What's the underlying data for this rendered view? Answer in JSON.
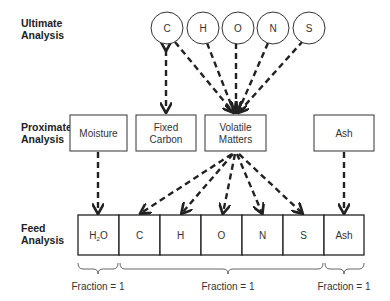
{
  "row_labels": {
    "ultimate": [
      "Ultimate",
      "Analysis"
    ],
    "proximate": [
      "Proximate",
      "Analysis"
    ],
    "feed": [
      "Feed",
      "Analysis"
    ]
  },
  "ultimate_elements": [
    "C",
    "H",
    "O",
    "N",
    "S"
  ],
  "proximate_components": {
    "moisture": [
      "Moisture"
    ],
    "fixed_carbon": [
      "Fixed",
      "Carbon"
    ],
    "volatile_matters": [
      "Volatile",
      "Matters"
    ],
    "ash": [
      "Ash"
    ]
  },
  "feed_cells": [
    "H",
    "C",
    "H",
    "O",
    "N",
    "S",
    "Ash"
  ],
  "feed_h2o": {
    "base": "H",
    "sub": "2",
    "tail": "O"
  },
  "fractions": [
    "Fraction = 1",
    "Fraction = 1",
    "Fraction = 1"
  ]
}
